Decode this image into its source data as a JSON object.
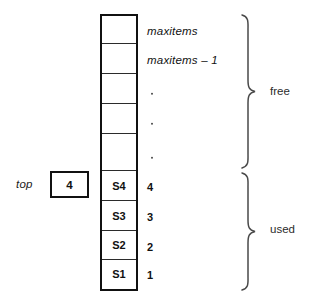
{
  "diagram": {
    "background_color": "#ffffff",
    "line_color": "#111111"
  },
  "pointer": {
    "name": "top-pointer",
    "label": "top",
    "value": "4"
  },
  "array": {
    "name": "stack-array",
    "cell_count": 9,
    "cells": [
      {
        "content": "",
        "index_label": "maxitems",
        "index_kind": "word",
        "region": "free"
      },
      {
        "content": "",
        "index_label": "maxitems – 1",
        "index_kind": "word",
        "region": "free"
      },
      {
        "content": "",
        "index_label": ".",
        "index_kind": "dot",
        "region": "free"
      },
      {
        "content": "",
        "index_label": ".",
        "index_kind": "dot",
        "region": "free"
      },
      {
        "content": "",
        "index_label": ".",
        "index_kind": "dot",
        "region": "free"
      },
      {
        "content": "S4",
        "index_label": "4",
        "index_kind": "num",
        "region": "used"
      },
      {
        "content": "S3",
        "index_label": "3",
        "index_kind": "num",
        "region": "used"
      },
      {
        "content": "S2",
        "index_label": "2",
        "index_kind": "num",
        "region": "used"
      },
      {
        "content": "S1",
        "index_label": "1",
        "index_kind": "num",
        "region": "used"
      }
    ]
  },
  "braces": {
    "free": {
      "label": "free"
    },
    "used": {
      "label": "used"
    }
  }
}
